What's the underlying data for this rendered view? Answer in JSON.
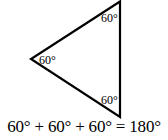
{
  "figure": {
    "type": "equilateral-triangle",
    "vertices": {
      "top": {
        "x": 120,
        "y": 1
      },
      "left": {
        "x": 31,
        "y": 59
      },
      "bottom": {
        "x": 120,
        "y": 117
      }
    },
    "stroke_color": "#000000",
    "stroke_width": 2.2
  },
  "angles": [
    {
      "position": "top",
      "label": "60°"
    },
    {
      "position": "left",
      "label": "60°"
    },
    {
      "position": "bottom",
      "label": "60°"
    }
  ],
  "equation": {
    "text": "60° + 60° + 60° = 180°"
  }
}
